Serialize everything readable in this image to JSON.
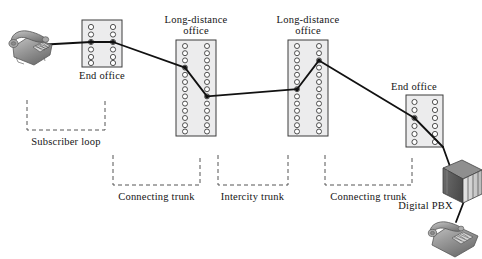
{
  "diagram": {
    "type": "telecom-network-diagram",
    "colors": {
      "switch_fill": "#ececed",
      "switch_stroke": "#3d3d3d",
      "circle_stroke": "#3d3d3d",
      "circle_fill": "#ffffff",
      "line": "#111111",
      "bracket": "#555555",
      "text": "#141414",
      "phone_body": "#9a9a9a",
      "phone_shade": "#6e6e6e",
      "pbx_front": "#5f5f5f",
      "pbx_panel": "#d8d8d8"
    }
  },
  "labels": {
    "end_office_left": "End office",
    "long_distance_office_1": "Long-distance\noffice",
    "long_distance_office_1_line1": "Long-distance",
    "long_distance_office_1_line2": "office",
    "long_distance_office_2_line1": "Long-distance",
    "long_distance_office_2_line2": "office",
    "end_office_right": "End office",
    "subscriber_loop": "Subscriber loop",
    "connecting_trunk_left": "Connecting trunk",
    "intercity_trunk": "Intercity trunk",
    "connecting_trunk_right": "Connecting trunk",
    "digital_pbx": "Digital PBX"
  },
  "nodes": [
    {
      "id": "subscriber-phone",
      "kind": "telephone",
      "label": null
    },
    {
      "id": "end-office-left",
      "kind": "switch",
      "label": "End office",
      "columns": 2,
      "circles_per_column": 6
    },
    {
      "id": "long-distance-office-1",
      "kind": "switch",
      "label": "Long-distance office",
      "columns": 2,
      "circles_per_column": 13
    },
    {
      "id": "long-distance-office-2",
      "kind": "switch",
      "label": "Long-distance office",
      "columns": 2,
      "circles_per_column": 13
    },
    {
      "id": "end-office-right",
      "kind": "switch",
      "label": "End office",
      "columns": 2,
      "circles_per_column": 6
    },
    {
      "id": "digital-pbx",
      "kind": "cabinet",
      "label": "Digital PBX"
    },
    {
      "id": "pbx-phone",
      "kind": "telephone",
      "label": null
    }
  ],
  "spans": [
    {
      "id": "subscriber-loop",
      "label": "Subscriber loop",
      "from": "subscriber-phone",
      "to": "end-office-left"
    },
    {
      "id": "connecting-trunk-left",
      "label": "Connecting trunk",
      "from": "end-office-left",
      "to": "long-distance-office-1"
    },
    {
      "id": "intercity-trunk",
      "label": "Intercity trunk",
      "from": "long-distance-office-1",
      "to": "long-distance-office-2"
    },
    {
      "id": "connecting-trunk-right",
      "label": "Connecting trunk",
      "from": "long-distance-office-2",
      "to": "end-office-right"
    }
  ]
}
